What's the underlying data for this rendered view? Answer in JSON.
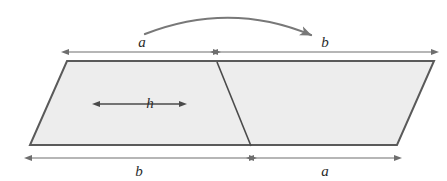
{
  "figure": {
    "type": "geometry-diagram",
    "background_color": "#ffffff",
    "shape": {
      "name": "parallelogram",
      "fill_color": "#ededed",
      "stroke_color": "#5a5a5a",
      "stroke_width": 2,
      "vertices": [
        {
          "name": "top-left",
          "x": 67,
          "y": 61
        },
        {
          "name": "top-right",
          "x": 434,
          "y": 61
        },
        {
          "name": "bottom-right",
          "x": 397,
          "y": 145
        },
        {
          "name": "bottom-left",
          "x": 30,
          "y": 145
        }
      ],
      "cut_line": {
        "name": "interior-diagonal-cut",
        "x1": 217,
        "y1": 62,
        "x2": 251,
        "y2": 146,
        "stroke_color": "#4a4a4a",
        "stroke_width": 1.6
      }
    },
    "height_marker": {
      "name": "height",
      "label": "h",
      "x": 139,
      "y_top": 62,
      "y_bottom": 146,
      "label_x": 150,
      "label_y": 108,
      "stroke_color": "#4a4a4a"
    },
    "top_dimension": {
      "name": "top-dimension-line",
      "y": 52,
      "x_start": 67,
      "x_end": 434,
      "x_split": 216,
      "stroke_color": "#6e6e6e",
      "segments": [
        {
          "name": "top-left-segment",
          "label": "a",
          "label_x": 142,
          "label_y": 47
        },
        {
          "name": "top-right-segment",
          "label": "b",
          "label_x": 325,
          "label_y": 47
        }
      ]
    },
    "bottom_dimension": {
      "name": "bottom-dimension-line",
      "y": 158,
      "x_start": 30,
      "x_end": 397,
      "x_split": 252,
      "stroke_color": "#6e6e6e",
      "segments": [
        {
          "name": "bottom-left-segment",
          "label": "b",
          "label_x": 139,
          "label_y": 176
        },
        {
          "name": "bottom-right-segment",
          "label": "a",
          "label_x": 325,
          "label_y": 176
        }
      ]
    },
    "motion_arrow": {
      "name": "rearrangement-arrow",
      "description": "curved arrow from a to b",
      "stroke_color": "#787878",
      "stroke_width": 2.2,
      "start_x": 145,
      "start_y": 34,
      "control_x": 230,
      "control_y": 1,
      "end_x": 314,
      "end_y": 36
    }
  }
}
